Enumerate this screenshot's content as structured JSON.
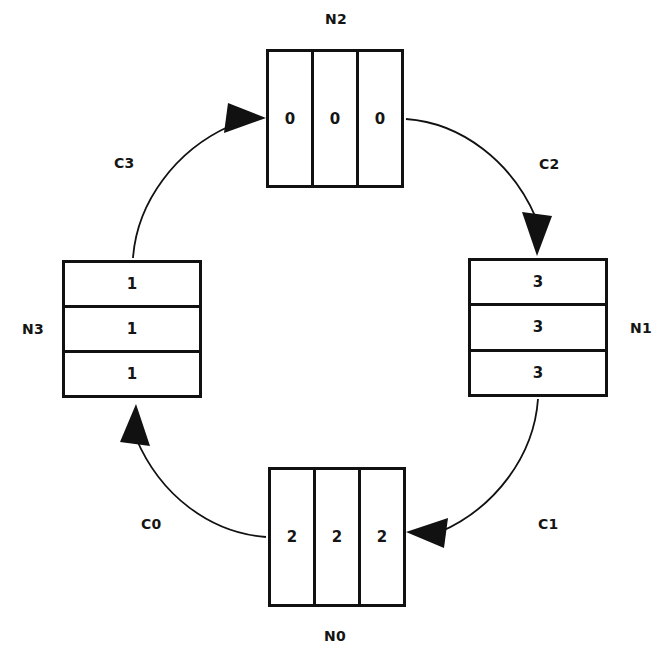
{
  "diagram": {
    "canvas": {
      "width": 664,
      "height": 655
    },
    "stroke_color": "#111111",
    "background_color": "#ffffff",
    "nodes": [
      {
        "id": "N0",
        "label": "N0",
        "label_position": "below",
        "orientation": "horizontal",
        "cells": [
          "2",
          "2",
          "2"
        ],
        "box": {
          "x": 268,
          "y": 467,
          "width": 138,
          "height": 140
        },
        "label_x": 324,
        "label_y": 628
      },
      {
        "id": "N1",
        "label": "N1",
        "label_position": "right",
        "orientation": "vertical",
        "cells": [
          "3",
          "3",
          "3"
        ],
        "box": {
          "x": 468,
          "y": 258,
          "width": 140,
          "height": 139
        },
        "label_x": 630,
        "label_y": 320
      },
      {
        "id": "N2",
        "label": "N2",
        "label_position": "above",
        "orientation": "horizontal",
        "cells": [
          "0",
          "0",
          "0"
        ],
        "box": {
          "x": 266,
          "y": 49,
          "width": 138,
          "height": 139
        },
        "label_x": 325,
        "label_y": 11
      },
      {
        "id": "N3",
        "label": "N3",
        "label_position": "left",
        "orientation": "vertical",
        "cells": [
          "1",
          "1",
          "1"
        ],
        "box": {
          "x": 62,
          "y": 260,
          "width": 140,
          "height": 138
        },
        "label_x": 22,
        "label_y": 321
      }
    ],
    "edges": [
      {
        "id": "C0",
        "label": "C0",
        "from": "N0",
        "to": "N3",
        "path": "M 266 537 C 210 533 160 495 136 438",
        "arrow_points": "136,404 150,446 120,442",
        "label_x": 141,
        "label_y": 516
      },
      {
        "id": "C1",
        "label": "C1",
        "from": "N1",
        "to": "N0",
        "path": "M 538 399 C 534 456 495 508 440 532",
        "arrow_points": "406,532 448,518 444,548",
        "label_x": 538,
        "label_y": 516
      },
      {
        "id": "C2",
        "label": "C2",
        "from": "N2",
        "to": "N1",
        "path": "M 406 119 C 462 123 512 162 536 218",
        "arrow_points": "537,256 522,212 552,216",
        "label_x": 539,
        "label_y": 156
      },
      {
        "id": "C3",
        "label": "C3",
        "from": "N3",
        "to": "N2",
        "path": "M 133 258 C 137 202 176 150 230 126",
        "arrow_points": "266,118 224,133 228,103",
        "label_x": 114,
        "label_y": 155
      }
    ]
  }
}
